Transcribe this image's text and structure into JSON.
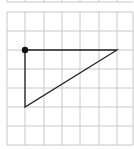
{
  "diagram": {
    "type": "grid-triangle",
    "colors": {
      "background": "#ffffff",
      "grid": "#c8c8c8",
      "shape": "#222222",
      "point": "#111111"
    },
    "top_strip": {
      "y_bottom": 2,
      "x_lines": [
        7,
        25,
        44,
        62,
        80,
        99,
        117
      ]
    },
    "grid": {
      "x_lines": [
        7,
        25,
        44,
        62,
        80,
        99,
        117,
        133
      ],
      "y_lines": [
        12,
        31,
        50,
        69,
        88,
        107,
        126,
        145
      ],
      "x_min": 7,
      "x_max": 133,
      "y_min": 12,
      "y_max": 145
    },
    "triangle": {
      "vertices": [
        [
          25,
          50
        ],
        [
          117,
          50
        ],
        [
          25,
          107
        ]
      ],
      "grid_coords": [
        [
          1,
          2
        ],
        [
          6,
          2
        ],
        [
          1,
          5
        ]
      ]
    },
    "point": {
      "x": 25,
      "y": 50,
      "r": 3.2,
      "label": ""
    }
  }
}
